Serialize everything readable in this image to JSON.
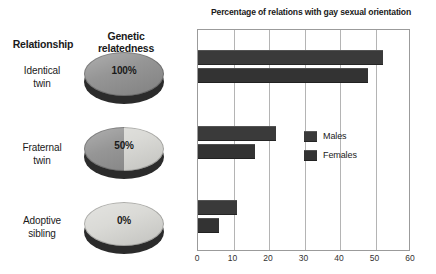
{
  "left_panel": {
    "headers": {
      "relationship": "Relationship",
      "genetic_relatedness": "Genetic\nrelatedness"
    },
    "rows": [
      {
        "relationship": "Identical\ntwin",
        "relatedness_label": "100%",
        "relatedness_value": 100
      },
      {
        "relationship": "Fraternal\ntwin",
        "relatedness_label": "50%",
        "relatedness_value": 50
      },
      {
        "relationship": "Adoptive\nsibling",
        "relatedness_label": "0%",
        "relatedness_value": 0
      }
    ]
  },
  "chart_data": {
    "type": "bar",
    "orientation": "horizontal",
    "title": "Percentage of relations with gay sexual orientation",
    "xlabel": "",
    "ylabel": "",
    "xlim": [
      0,
      60
    ],
    "xticks": [
      0,
      10,
      20,
      30,
      40,
      50,
      60
    ],
    "xtick_labels": [
      "0",
      "10",
      "20",
      "30",
      "40",
      "50",
      "60"
    ],
    "grid": true,
    "grid_axis": "x",
    "legend_position": "center-right",
    "categories": [
      "Identical twin",
      "Fraternal twin",
      "Adoptive sibling"
    ],
    "series": [
      {
        "name": "Males",
        "color": "#3a3a3a",
        "values": [
          52,
          22,
          11
        ]
      },
      {
        "name": "Females",
        "color": "#333333",
        "values": [
          48,
          16,
          6
        ]
      }
    ]
  },
  "colors": {
    "bar_males": "#3a3a3a",
    "bar_females": "#333333",
    "disc_dark": "#8f8f8f",
    "disc_light": "#d8d8d4",
    "disc_side": "#2b2b2b",
    "plot_border": "#9b9b9b",
    "gridline": "#b4b4b4",
    "text": "#1a1a1a",
    "background": "#ffffff"
  }
}
